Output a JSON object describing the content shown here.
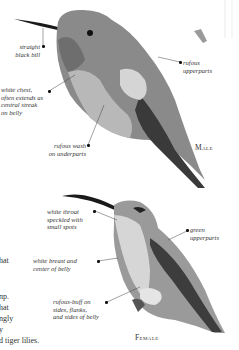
{
  "page": {
    "male": {
      "sex_label": "Male",
      "labels": [
        {
          "id": "bill",
          "text": "straight\nblack bill"
        },
        {
          "id": "chest",
          "text": "white chest,\noften extends as\ncentral streak\non belly"
        },
        {
          "id": "underparts",
          "text": "rufous wash\non underparts"
        },
        {
          "id": "upperparts",
          "text": "rufous\nupperparts"
        }
      ]
    },
    "female": {
      "sex_label": "Female",
      "labels": [
        {
          "id": "throat",
          "text": "white throat\nspeckled with\nsmall spots"
        },
        {
          "id": "breast",
          "text": "white breast and\ncenter of belly"
        },
        {
          "id": "sides",
          "text": "rufous-buff on\nsides, flanks,\nand sides of belly"
        },
        {
          "id": "upperparts",
          "text": "green\nupperparts"
        }
      ]
    },
    "body_text_fragments": [
      "hat",
      "",
      "",
      "np.",
      "hat",
      "ngly",
      "y",
      "d tiger lilies."
    ]
  }
}
